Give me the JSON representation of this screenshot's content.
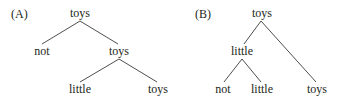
{
  "diagrams": [
    {
      "id": "A",
      "label": "(A)",
      "label_pos": [
        11,
        18
      ],
      "nodes": [
        {
          "text": "toys",
          "x": 80,
          "y": 17
        },
        {
          "text": "not",
          "x": 42,
          "y": 55
        },
        {
          "text": "toys",
          "x": 119,
          "y": 55
        },
        {
          "text": "little",
          "x": 80,
          "y": 93
        },
        {
          "text": "toys",
          "x": 158,
          "y": 93
        }
      ],
      "edges": [
        {
          "from": [
            80,
            21
          ],
          "to": [
            42,
            44
          ]
        },
        {
          "from": [
            80,
            21
          ],
          "to": [
            118,
            44
          ]
        },
        {
          "from": [
            119,
            59
          ],
          "to": [
            80,
            82
          ]
        },
        {
          "from": [
            119,
            59
          ],
          "to": [
            157,
            82
          ]
        }
      ]
    },
    {
      "id": "B",
      "label": "(B)",
      "label_pos": [
        195,
        18
      ],
      "nodes": [
        {
          "text": "toys",
          "x": 262,
          "y": 17
        },
        {
          "text": "little",
          "x": 242,
          "y": 55
        },
        {
          "text": "not",
          "x": 223,
          "y": 93
        },
        {
          "text": "little",
          "x": 262,
          "y": 93
        },
        {
          "text": "toys",
          "x": 317,
          "y": 93
        }
      ],
      "edges": [
        {
          "from": [
            261,
            21
          ],
          "to": [
            244,
            44
          ]
        },
        {
          "from": [
            261,
            21
          ],
          "to": [
            316,
            82
          ]
        },
        {
          "from": [
            242,
            59
          ],
          "to": [
            224,
            82
          ]
        },
        {
          "from": [
            242,
            59
          ],
          "to": [
            261,
            82
          ]
        }
      ]
    }
  ]
}
